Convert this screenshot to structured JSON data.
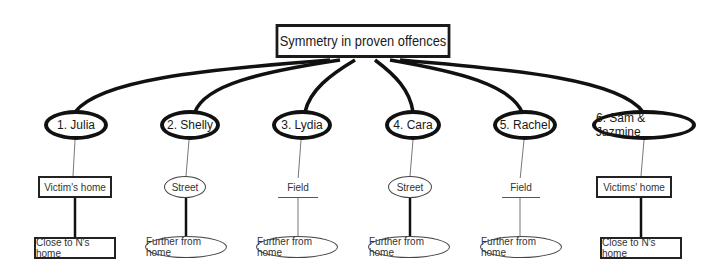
{
  "title": "Symmetry in proven offences",
  "cases": [
    {
      "label": "1. Julia",
      "location": "Victim's home",
      "location_shape": "rect",
      "distance": "Close to N's home",
      "distance_shape": "rect"
    },
    {
      "label": "2. Shelly",
      "location": "Street",
      "location_shape": "ellipse",
      "distance": "Further from home",
      "distance_shape": "ellipse"
    },
    {
      "label": "3. Lydia",
      "location": "Field",
      "location_shape": "plain",
      "distance": "Further from home",
      "distance_shape": "ellipse"
    },
    {
      "label": "4. Cara",
      "location": "Street",
      "location_shape": "ellipse",
      "distance": "Further from home",
      "distance_shape": "ellipse"
    },
    {
      "label": "5. Rachel",
      "location": "Field",
      "location_shape": "plain",
      "distance": "Further from home",
      "distance_shape": "ellipse"
    },
    {
      "label": "6. Sam & Jazmine",
      "location": "Victims' home",
      "location_shape": "rect",
      "distance": "Close to N's home",
      "distance_shape": "rect"
    }
  ]
}
